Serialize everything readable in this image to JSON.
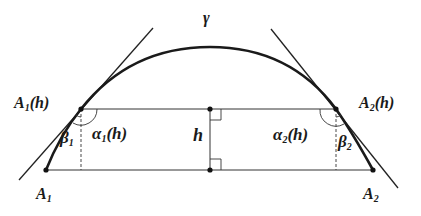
{
  "diagram": {
    "curve_label": "γ",
    "height_label": "h",
    "points": {
      "A1h": {
        "label": "A",
        "sub": "1",
        "suffix": "(h)"
      },
      "A2h": {
        "label": "A",
        "sub": "2",
        "suffix": "(h)"
      },
      "A1": {
        "label": "A",
        "sub": "1"
      },
      "A2": {
        "label": "A",
        "sub": "2"
      }
    },
    "angles": {
      "alpha1": {
        "label": "α",
        "sub": "1",
        "suffix": "(h)"
      },
      "alpha2": {
        "label": "α",
        "sub": "2",
        "suffix": "(h)"
      },
      "beta1": {
        "label": "β",
        "sub": "1"
      },
      "beta2": {
        "label": "β",
        "sub": "2"
      }
    },
    "colors": {
      "stroke": "#1a1a1a",
      "thin": "#333333"
    }
  }
}
